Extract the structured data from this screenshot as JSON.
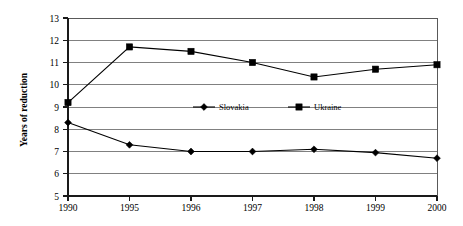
{
  "chart_data": {
    "type": "line",
    "title": "",
    "xlabel": "",
    "ylabel": "Years of reduction",
    "categories": [
      "1990",
      "1995",
      "1996",
      "1997",
      "1998",
      "1999",
      "2000"
    ],
    "x": [
      1990,
      1995,
      1996,
      1997,
      1998,
      1999,
      2000
    ],
    "series": [
      {
        "name": "Slovakia",
        "marker": "diamond",
        "values": [
          8.3,
          7.3,
          7.0,
          7.0,
          7.1,
          6.95,
          6.7
        ]
      },
      {
        "name": "Ukraine",
        "marker": "square",
        "values": [
          9.2,
          11.7,
          11.5,
          11.0,
          10.35,
          10.7,
          10.9
        ]
      }
    ],
    "ylim": [
      5,
      13
    ],
    "yticks": [
      5,
      6,
      7,
      8,
      9,
      10,
      11,
      12,
      13
    ],
    "ytick_labels": [
      "5",
      "6",
      "7",
      "8",
      "9",
      "10",
      "11",
      "12",
      "13"
    ],
    "grid": true,
    "grid_axis": "y",
    "legend_position": "center",
    "colors": {
      "series": "#000000",
      "gridline": "#808080",
      "border": "#595959",
      "background": "#ffffff"
    }
  },
  "legend": {
    "entries": [
      {
        "label": "Slovakia",
        "marker": "diamond"
      },
      {
        "label": "Ukraine",
        "marker": "square"
      }
    ]
  },
  "axes": {
    "y_title": "Years of reduction",
    "y_tick_13": "13",
    "y_tick_12": "12",
    "y_tick_11": "11",
    "y_tick_10": "10",
    "y_tick_9": "9",
    "y_tick_8": "8",
    "y_tick_7": "7",
    "y_tick_6": "6",
    "y_tick_5": "5",
    "x_tick_1990": "1990",
    "x_tick_1995": "1995",
    "x_tick_1996": "1996",
    "x_tick_1997": "1997",
    "x_tick_1998": "1998",
    "x_tick_1999": "1999",
    "x_tick_2000": "2000"
  }
}
